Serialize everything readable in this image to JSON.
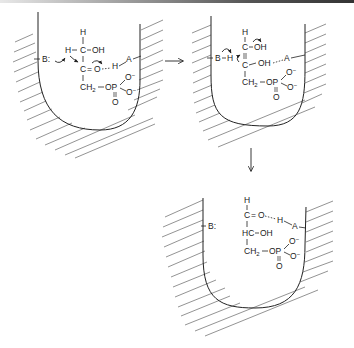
{
  "diagram": {
    "type": "enzyme-mechanism",
    "colors": {
      "ink": "#222222",
      "hatch": "#666666",
      "background": "#ffffff"
    },
    "panels": [
      {
        "id": "panel-1",
        "base": "B:",
        "acid": "A",
        "atoms": {
          "top_h": "H",
          "row1": "H",
          "row1_c": "C",
          "row1_oh": "OH",
          "row2_c": "C",
          "row2_eq": "=",
          "row2_o": "O",
          "hbond_h": "H",
          "ch2": "CH",
          "ch2_sub": "2",
          "op": "OP",
          "o_top": "O",
          "o_top_charge": "−",
          "o_bottom": "O",
          "o_bottom_charge": "−",
          "o_double": "O"
        }
      },
      {
        "id": "panel-2",
        "base": "B",
        "base_h": "H",
        "acid": "A",
        "atoms": {
          "top_h": "H",
          "row1_c": "C",
          "row1_oh": "OH",
          "row2_c": "C",
          "row2_oh": "OH",
          "ch2": "CH",
          "ch2_sub": "2",
          "op": "OP",
          "o_top": "O",
          "o_top_charge": "−",
          "o_bottom": "O",
          "o_bottom_charge": "−",
          "o_double": "O"
        }
      },
      {
        "id": "panel-3",
        "base": "B:",
        "acid": "A",
        "atoms": {
          "top_h": "H",
          "row1_c": "C",
          "row1_eq": "=",
          "row1_o": "O",
          "hbond_h": "H",
          "row2": "HC",
          "row2_oh": "OH",
          "ch2": "CH",
          "ch2_sub": "2",
          "op": "OP",
          "o_top": "O",
          "o_top_charge": "−",
          "o_bottom": "O",
          "o_bottom_charge": "−",
          "o_double": "O"
        }
      }
    ],
    "arrows": [
      {
        "from": "panel-1",
        "to": "panel-2",
        "direction": "right"
      },
      {
        "from": "panel-2",
        "to": "panel-3",
        "direction": "down"
      }
    ]
  }
}
